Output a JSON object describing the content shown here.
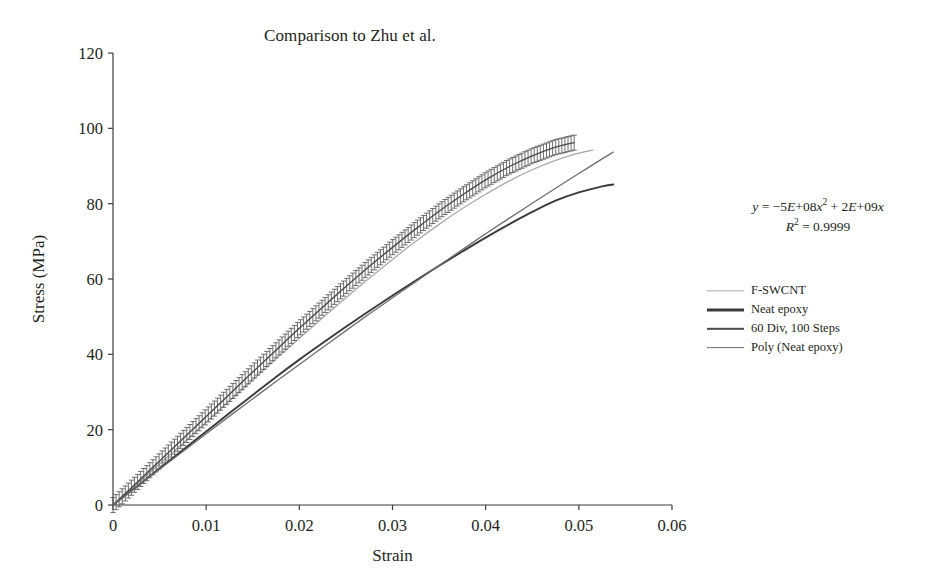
{
  "chart_data": {
    "type": "line",
    "title": "Comparison to Zhu et al.",
    "xlabel": "Strain",
    "ylabel": "Stress (MPa)",
    "xlim": [
      0,
      0.06
    ],
    "ylim": [
      0,
      120
    ],
    "xticks": [
      "0",
      "0.01",
      "0.02",
      "0.03",
      "0.04",
      "0.05",
      "0.06"
    ],
    "xtick_values": [
      0,
      0.01,
      0.02,
      0.03,
      0.04,
      0.05,
      0.06
    ],
    "yticks": [
      "0",
      "20",
      "40",
      "60",
      "80",
      "100",
      "120"
    ],
    "ytick_values": [
      0,
      20,
      40,
      60,
      80,
      100,
      120
    ],
    "grid": false,
    "legend_position": "right",
    "annotations": [
      {
        "name": "trendline-equation",
        "line1": "y = −5E+08x",
        "line1_sup": "2",
        "line1_tail": " + 2E+09x",
        "line2": "R",
        "line2_sup": "2",
        "line2_tail": " = 0.9999"
      }
    ],
    "series": [
      {
        "name": "F-SWCNT",
        "color": "#a8a8a8",
        "width": 1.3,
        "error_bars": false,
        "x": [
          0,
          0.0025,
          0.005,
          0.0075,
          0.01,
          0.0125,
          0.015,
          0.0175,
          0.02,
          0.0225,
          0.025,
          0.0275,
          0.03,
          0.0325,
          0.035,
          0.0375,
          0.04,
          0.0425,
          0.045,
          0.0475,
          0.05,
          0.0515
        ],
        "y": [
          0,
          5.4,
          10.9,
          16.4,
          22.0,
          27.6,
          33.2,
          38.8,
          44.3,
          49.7,
          55.0,
          60.2,
          65.2,
          70.0,
          74.5,
          78.7,
          82.5,
          86.0,
          89.0,
          91.5,
          93.4,
          94.2
        ]
      },
      {
        "name": "Neat epoxy",
        "color": "#3a3a3a",
        "width": 1.9,
        "error_bars": false,
        "x": [
          0,
          0.0025,
          0.005,
          0.0075,
          0.01,
          0.0125,
          0.015,
          0.0175,
          0.02,
          0.0225,
          0.025,
          0.0275,
          0.03,
          0.0325,
          0.035,
          0.0375,
          0.04,
          0.0425,
          0.045,
          0.0475,
          0.05,
          0.0525,
          0.0537
        ],
        "y": [
          0,
          4.8,
          9.7,
          14.6,
          19.5,
          24.4,
          29.2,
          34.0,
          38.6,
          43.0,
          47.3,
          51.5,
          55.6,
          59.6,
          63.5,
          67.3,
          71.0,
          74.5,
          77.8,
          80.8,
          83.0,
          84.6,
          85.1
        ]
      },
      {
        "name": "60 Div, 100 Steps",
        "color": "#4a4a4a",
        "width": 1.4,
        "error_bars": true,
        "error_value": 2.0,
        "x": [
          0,
          0.0025,
          0.005,
          0.0075,
          0.01,
          0.0125,
          0.015,
          0.0175,
          0.02,
          0.0225,
          0.025,
          0.0275,
          0.03,
          0.0325,
          0.035,
          0.0375,
          0.04,
          0.0425,
          0.045,
          0.0475,
          0.0495
        ],
        "y": [
          0,
          5.8,
          11.7,
          17.6,
          23.5,
          29.4,
          35.3,
          41.1,
          46.9,
          52.5,
          58.0,
          63.3,
          68.4,
          73.3,
          78.0,
          82.3,
          86.3,
          89.8,
          92.7,
          95.0,
          96.2
        ]
      },
      {
        "name": "Poly (Neat epoxy)",
        "color": "#6d6d6d",
        "width": 1.3,
        "error_bars": false,
        "trendline": true,
        "x": [
          0,
          0.0025,
          0.005,
          0.0075,
          0.01,
          0.0125,
          0.015,
          0.0175,
          0.02,
          0.0225,
          0.025,
          0.0275,
          0.03,
          0.0325,
          0.035,
          0.0375,
          0.04,
          0.0425,
          0.045,
          0.0475,
          0.05,
          0.0525,
          0.0537
        ],
        "y": [
          0,
          4.7,
          9.5,
          14.2,
          18.9,
          23.6,
          28.2,
          32.8,
          37.3,
          41.8,
          46.3,
          50.7,
          55.0,
          59.3,
          63.6,
          67.8,
          72.0,
          76.1,
          80.1,
          84.1,
          88.0,
          91.9,
          93.7
        ]
      }
    ],
    "legend": [
      {
        "label": "F-SWCNT",
        "color": "#a8a8a8",
        "width": 1.3
      },
      {
        "label": "Neat epoxy",
        "color": "#3a3a3a",
        "width": 3.0
      },
      {
        "label": "60 Div, 100 Steps",
        "color": "#4a4a4a",
        "width": 2.4
      },
      {
        "label": "Poly (Neat epoxy)",
        "color": "#6d6d6d",
        "width": 1.8
      }
    ]
  }
}
